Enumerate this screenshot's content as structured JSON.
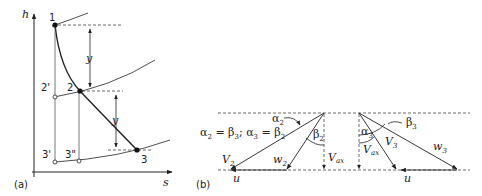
{
  "panel_a": {
    "caption": "(a)",
    "axis_y_label": "h",
    "axis_x_label": "s",
    "points": {
      "p1": "1",
      "p2": "2",
      "p3": "3",
      "p2prime": "2'",
      "p3prime": "3'",
      "p3doubleprime": "3\""
    },
    "drop_label_upper": "y",
    "drop_label_lower": "y"
  },
  "panel_b": {
    "caption": "(b)",
    "relation": "α2 = β3; α3 = β2",
    "relation_parts": {
      "a": "α",
      "a_sub": "2",
      "eq1": " = β",
      "b_sub": "3",
      "sep": "; α",
      "a3_sub": "3",
      "eq2": " = β",
      "b2_sub": "2"
    },
    "left_triangle": {
      "alpha": "α",
      "alpha_sub": "2",
      "beta": "β",
      "beta_sub": "2",
      "V": "V",
      "V_sub": "2",
      "w": "w",
      "w_sub": "2",
      "Vax": "V",
      "Vax_sub": "ax",
      "u": "u"
    },
    "right_triangle": {
      "alpha": "α",
      "alpha_sub": "3",
      "beta": "β",
      "beta_sub": "3",
      "V": "V",
      "V_sub": "3",
      "w": "w",
      "w_sub": "3",
      "Vax": "V",
      "Vax_sub": "ax",
      "u": "u"
    }
  },
  "colors": {
    "line": "#222222",
    "dash": "#444444",
    "background": "#ffffff"
  }
}
